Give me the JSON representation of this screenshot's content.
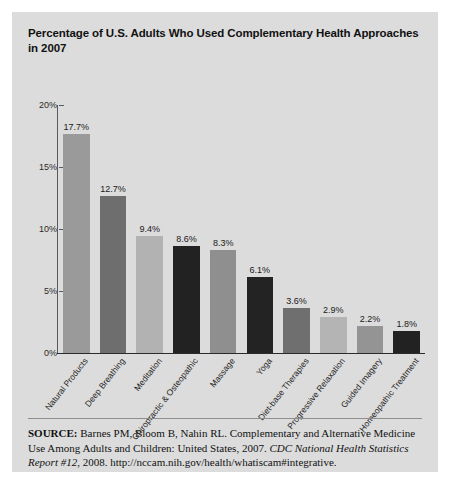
{
  "figure": {
    "title": "Percentage of U.S. Adults Who Used Complementary Health Approaches in 2007",
    "panel_color": "#dcdcdc",
    "page_color": "#ffffff"
  },
  "source": {
    "label": "SOURCE:",
    "citation": " Barnes PM, Bloom B, Nahin RL. Complementary and Alternative Medicine Use Among Adults and Children: United States, 2007. ",
    "italic_part": "CDC National Health Statistics Report #12",
    "tail": ", 2008. http://nccam.nih.gov/health/whatiscam#integrative."
  },
  "chart_data": {
    "type": "bar",
    "title": "Percentage of U.S. Adults Who Used Complementary Health Approaches in 2007",
    "xlabel": "",
    "ylabel": "",
    "ylim": [
      0,
      20
    ],
    "yticks": [
      0,
      5,
      10,
      15,
      20
    ],
    "ytick_labels": [
      "0%",
      "5%",
      "10%",
      "15%",
      "20%"
    ],
    "grid": false,
    "legend": "none",
    "value_suffix": "%",
    "categories": [
      "Natural Products",
      "Deep Breathing",
      "Meditation",
      "Chiropractic & Osteopathic",
      "Massage",
      "Yoga",
      "Diet-base Therapies",
      "Progressive Relaxation",
      "Guided Imagery",
      "Homeopathic Treatment"
    ],
    "values": [
      17.7,
      12.7,
      9.4,
      8.6,
      8.3,
      6.1,
      3.6,
      2.9,
      2.2,
      1.8
    ],
    "value_labels": [
      "17.7%",
      "12.7%",
      "9.4%",
      "8.6%",
      "8.3%",
      "6.1%",
      "3.6%",
      "2.9%",
      "2.2%",
      "1.8%"
    ],
    "bar_colors": [
      "#9a9a9a",
      "#6e6e6e",
      "#b2b2b2",
      "#222222",
      "#8f8f8f",
      "#232323",
      "#6f6f6f",
      "#b4b4b4",
      "#949494",
      "#222222"
    ]
  }
}
